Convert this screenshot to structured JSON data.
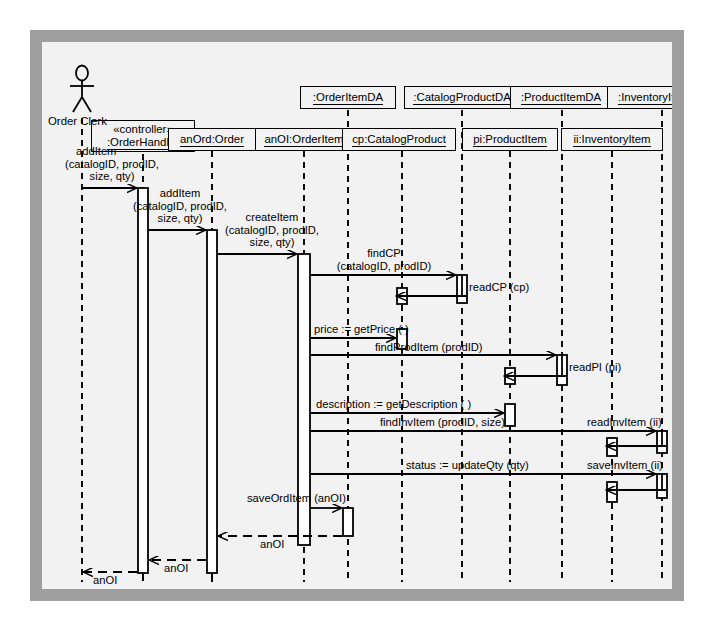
{
  "diagram": {
    "type": "uml-sequence-diagram",
    "actor": {
      "name": "Order Clerk",
      "icon": "stick-figure-actor-icon",
      "x": 40
    },
    "objects": [
      {
        "id": "orderHandler",
        "stereotype": "«controller»",
        "name": ":OrderHandler",
        "x": 101,
        "box_y": 78,
        "two_line": true
      },
      {
        "id": "anOrdOrder",
        "name": "anOrd:Order",
        "x": 170,
        "box_y": 86,
        "two_line": false
      },
      {
        "id": "anOiOrderItem",
        "name": "anOI:OrderItem",
        "x": 262,
        "box_y": 86,
        "two_line": false
      },
      {
        "id": "orderItemDA",
        "name": ":OrderItemDA",
        "x": 306,
        "box_y": 44,
        "two_line": false
      },
      {
        "id": "cpCatalogProduct",
        "name": "cp:CatalogProduct",
        "x": 360,
        "box_y": 86,
        "two_line": false
      },
      {
        "id": "catalogProductDA",
        "name": ":CatalogProductDA",
        "x": 420,
        "box_y": 44,
        "two_line": false
      },
      {
        "id": "piProductItem",
        "name": "pi:ProductItem",
        "x": 468,
        "box_y": 86,
        "two_line": false
      },
      {
        "id": "productItemDA",
        "name": ":ProductItemDA",
        "x": 520,
        "box_y": 44,
        "two_line": false
      },
      {
        "id": "iiInventoryItem",
        "name": "ii:InventoryItem",
        "x": 570,
        "box_y": 86,
        "two_line": false
      },
      {
        "id": "inventoryItemDA",
        "name": ":InventoryItemDA",
        "x": 620,
        "box_y": 44,
        "two_line": false
      }
    ],
    "messages": [
      {
        "id": "m1",
        "label": "addItem\n(catalogID, prodID,\n size, qty)",
        "kind": "call",
        "from": "actor",
        "to": "orderHandler"
      },
      {
        "id": "m2",
        "label": "addItem\n(catalogID, prodID,\n size, qty)",
        "kind": "call",
        "from": "orderHandler",
        "to": "anOrdOrder"
      },
      {
        "id": "m3",
        "label": "createItem\n(catalogID, prodID,\n size, qty)",
        "kind": "call",
        "from": "anOrdOrder",
        "to": "anOiOrderItem"
      },
      {
        "id": "m4",
        "label": "findCP\n(catalogID, prodID)",
        "kind": "call",
        "from": "anOiOrderItem",
        "to": "catalogProductDA"
      },
      {
        "id": "m5",
        "label": "readCP (cp)",
        "kind": "call",
        "from": "catalogProductDA",
        "to": "cpCatalogProduct"
      },
      {
        "id": "m6",
        "label": "price := getPrice ( )",
        "kind": "call",
        "from": "anOiOrderItem",
        "to": "cpCatalogProduct"
      },
      {
        "id": "m7",
        "label": "findProdItem (prodID)",
        "kind": "call",
        "from": "anOiOrderItem",
        "to": "productItemDA"
      },
      {
        "id": "m8",
        "label": "readPI (pi)",
        "kind": "call",
        "from": "productItemDA",
        "to": "piProductItem"
      },
      {
        "id": "m9",
        "label": "description := getDescription ( )",
        "kind": "call",
        "from": "anOiOrderItem",
        "to": "piProductItem"
      },
      {
        "id": "m10",
        "label": "findInvItem (prodID, size)",
        "kind": "call",
        "from": "anOiOrderItem",
        "to": "inventoryItemDA"
      },
      {
        "id": "m11",
        "label": "readInvItem (ii)",
        "kind": "call",
        "from": "inventoryItemDA",
        "to": "iiInventoryItem"
      },
      {
        "id": "m12",
        "label": "status := updateQty (qty)",
        "kind": "call",
        "from": "anOiOrderItem",
        "to": "inventoryItemDA"
      },
      {
        "id": "m13",
        "label": "saveInvItem (ii)",
        "kind": "call",
        "from": "inventoryItemDA",
        "to": "iiInventoryItem"
      },
      {
        "id": "m14",
        "label": "saveOrdItem (anOI)",
        "kind": "call",
        "from": "anOiOrderItem",
        "to": "orderItemDA"
      },
      {
        "id": "r1",
        "label": "anOI",
        "kind": "return",
        "from": "anOiOrderItem",
        "to": "anOrdOrder"
      },
      {
        "id": "r2",
        "label": "anOI",
        "kind": "return",
        "from": "anOrdOrder",
        "to": "orderHandler"
      },
      {
        "id": "r3",
        "label": "anOI",
        "kind": "return",
        "from": "orderHandler",
        "to": "actor"
      }
    ],
    "labels": {
      "actor_name": "Order Clerk",
      "obj_orderHandler_stereotype": "«controller»",
      "obj_orderHandler_name": ":OrderHandler",
      "obj_anOrdOrder": "anOrd:Order",
      "obj_anOiOrderItem": "anOI:OrderItem",
      "obj_orderItemDA": ":OrderItemDA",
      "obj_cpCatalogProduct": "cp:CatalogProduct",
      "obj_catalogProductDA": ":CatalogProductDA",
      "obj_piProductItem": "pi:ProductItem",
      "obj_productItemDA": ":ProductItemDA",
      "obj_iiInventoryItem": "ii:InventoryItem",
      "obj_inventoryItemDA": ":InventoryItemDA",
      "msg_addItem_1_l1": "addItem",
      "msg_addItem_1_l2": "(catalogID, prodID,",
      "msg_addItem_1_l3": "size, qty)",
      "msg_addItem_2_l1": "addItem",
      "msg_addItem_2_l2": "(catalogID, prodID,",
      "msg_addItem_2_l3": "size, qty)",
      "msg_createItem_l1": "createItem",
      "msg_createItem_l2": "(catalogID, prodID,",
      "msg_createItem_l3": "size, qty)",
      "msg_findCP_l1": "findCP",
      "msg_findCP_l2": "(catalogID, prodID)",
      "msg_readCP": "readCP (cp)",
      "msg_getPrice": "price := getPrice ( )",
      "msg_findProdItem": "findProdItem (prodID)",
      "msg_readPI": "readPI (pi)",
      "msg_getDescription": "description := getDescription ( )",
      "msg_findInvItem": "findInvItem (prodID, size)",
      "msg_readInvItem": "readInvItem (ii)",
      "msg_updateQty": "status := updateQty (qty)",
      "msg_saveInvItem": "saveInvItem (ii)",
      "msg_saveOrdItem": "saveOrdItem (anOI)",
      "ret_anOI_1": "anOI",
      "ret_anOI_2": "anOI",
      "ret_anOI_3": "anOI"
    },
    "colors": {
      "frame_border": "#9f9f9f",
      "canvas_bg": "#f2f2f2",
      "line": "#000000",
      "activation_fill": "#ffffff"
    }
  }
}
